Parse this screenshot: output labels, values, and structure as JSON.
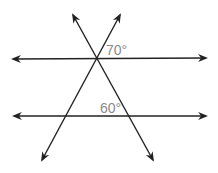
{
  "diagram": {
    "type": "parallel lines cut by transversals",
    "colors": {
      "line": "#222222",
      "label": "#8a8a8a",
      "background": "#ffffff"
    },
    "lines": [
      {
        "id": "parallel-top",
        "x1": 13,
        "y1": 59,
        "x2": 206,
        "y2": 58
      },
      {
        "id": "parallel-bottom",
        "x1": 14,
        "y1": 116,
        "x2": 206,
        "y2": 116
      },
      {
        "id": "transversal-left-to-right",
        "x1": 73,
        "y1": 15,
        "x2": 153,
        "y2": 160
      },
      {
        "id": "transversal-right-to-left",
        "x1": 120,
        "y1": 15,
        "x2": 42,
        "y2": 160
      }
    ],
    "angles": [
      {
        "id": "angle-top",
        "label": "70°",
        "x": 106,
        "y": 55
      },
      {
        "id": "angle-bottom",
        "label": "60°",
        "x": 100,
        "y": 113
      }
    ]
  }
}
